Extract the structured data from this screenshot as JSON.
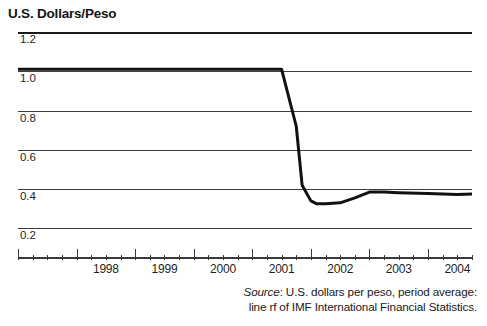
{
  "chart_data": {
    "type": "line",
    "title": "U.S. Dollars/Peso",
    "xlabel": "",
    "ylabel": "U.S. Dollars/Peso",
    "ylim": [
      0.1,
      1.2
    ],
    "xlim": [
      1997.0,
      2004.75
    ],
    "grid": true,
    "legend": null,
    "y_ticks": [
      "1.2",
      "1.0",
      "0.8",
      "0.6",
      "0.4",
      "0.2"
    ],
    "y_tick_values": [
      1.2,
      1.0,
      0.8,
      0.6,
      0.4,
      0.2
    ],
    "x_ticks": [
      "1998",
      "1999",
      "2000",
      "2001",
      "2002",
      "2003",
      "2004"
    ],
    "x_tick_values": [
      1998,
      1999,
      2000,
      2001,
      2002,
      2003,
      2004
    ],
    "x_minor_ticks_per_year": 4,
    "series": [
      {
        "name": "U.S. dollars per peso",
        "color": "#111111",
        "x": [
          1997.0,
          1997.5,
          1998.0,
          1998.5,
          1999.0,
          1999.5,
          2000.0,
          2000.5,
          2001.0,
          2001.25,
          2001.5,
          2001.75,
          2001.85,
          2002.0,
          2002.1,
          2002.25,
          2002.5,
          2002.75,
          2003.0,
          2003.25,
          2003.5,
          2004.0,
          2004.5,
          2004.75
        ],
        "y": [
          1.01,
          1.01,
          1.01,
          1.01,
          1.01,
          1.01,
          1.01,
          1.01,
          1.01,
          1.01,
          1.01,
          0.72,
          0.42,
          0.34,
          0.325,
          0.325,
          0.33,
          0.355,
          0.385,
          0.385,
          0.382,
          0.378,
          0.372,
          0.375
        ]
      }
    ],
    "annotations": []
  },
  "source": {
    "label": "Source",
    "separator": ": ",
    "line1": "U.S. dollars per peso, period average:",
    "line2": "line rf of IMF International Financial Statistics."
  }
}
